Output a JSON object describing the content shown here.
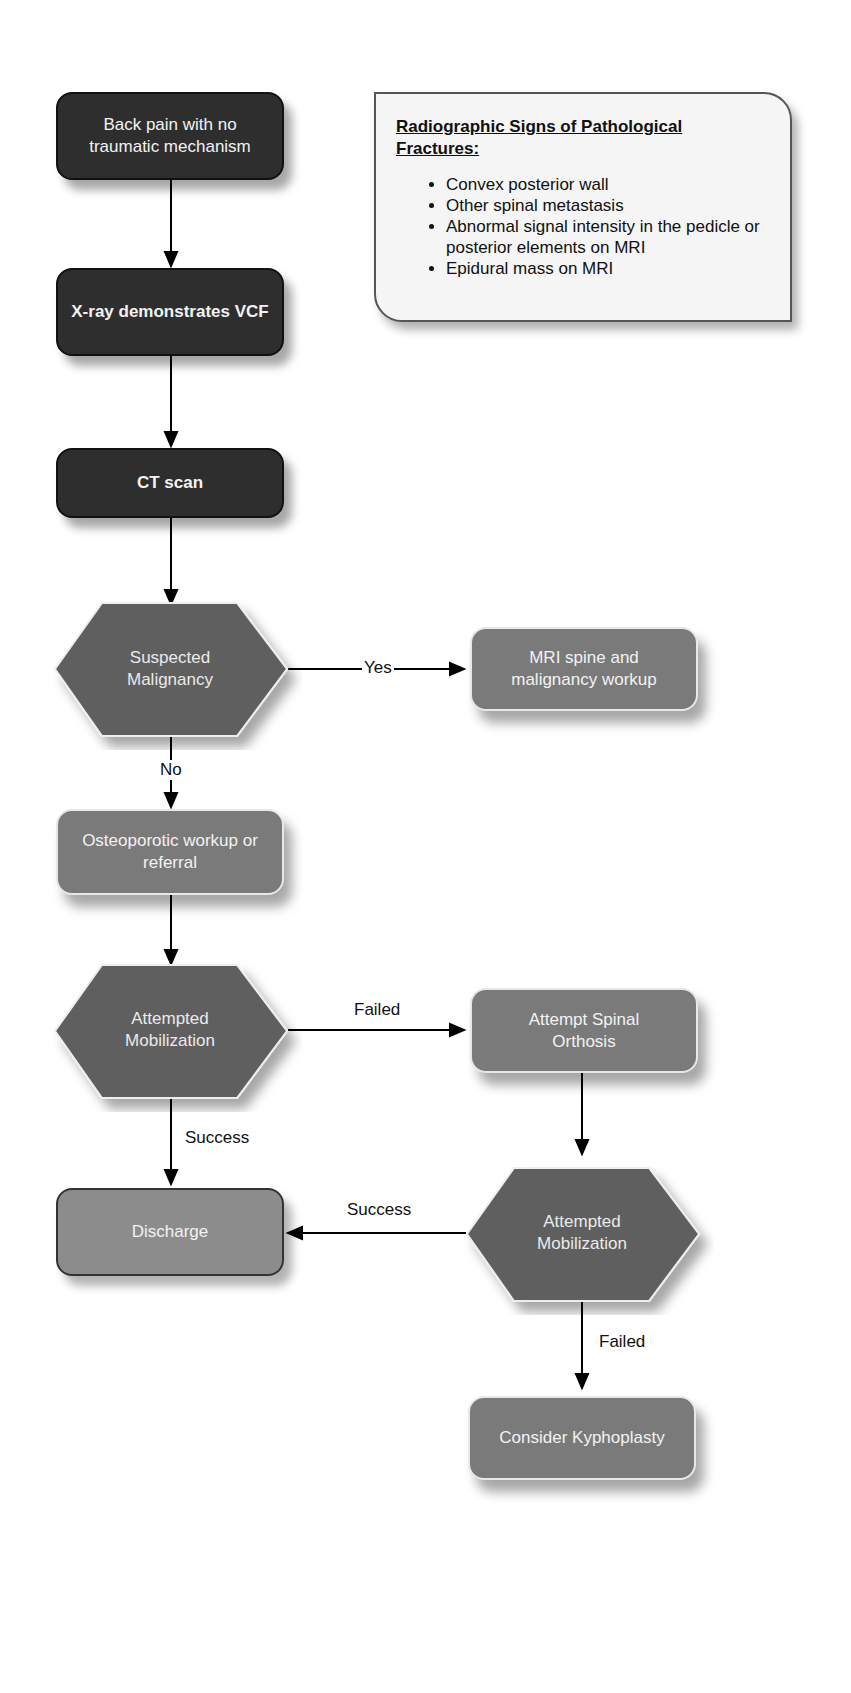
{
  "diagram": {
    "nodes": {
      "back_pain": "Back pain with no traumatic mechanism",
      "xray": "X-ray demonstrates VCF",
      "ct": "CT scan",
      "suspected_malignancy": "Suspected Malignancy",
      "mri": "MRI spine and malignancy workup",
      "osteoporotic": "Osteoporotic workup or referral",
      "attempted_mob_1": "Attempted Mobilization",
      "orthosis": "Attempt Spinal Orthosis",
      "discharge": "Discharge",
      "attempted_mob_2": "Attempted Mobilization",
      "kyphoplasty": "Consider Kyphoplasty"
    },
    "edge_labels": {
      "yes": "Yes",
      "no": "No",
      "failed_1": "Failed",
      "success_1": "Success",
      "success_2": "Success",
      "failed_2": "Failed"
    },
    "note": {
      "title": "Radiographic Signs of Pathological Fractures:",
      "items": [
        "Convex posterior wall",
        "Other spinal metastasis",
        "Abnormal signal intensity in the pedicle or posterior elements on MRI",
        "Epidural mass on MRI"
      ]
    }
  }
}
